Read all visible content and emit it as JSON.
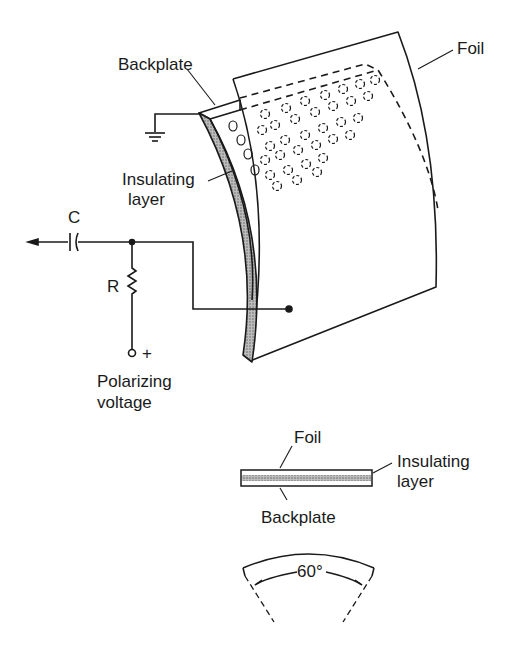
{
  "diagram": {
    "type": "electrostatic-microphone-schematic",
    "main_labels": {
      "backplate": "Backplate",
      "foil": "Foil",
      "insulating_line1": "Insulating",
      "insulating_line2": "layer",
      "capacitor": "C",
      "resistor": "R",
      "polarizing_line1": "Polarizing",
      "polarizing_line2": "voltage",
      "plus": "+"
    },
    "cross_section": {
      "foil": "Foil",
      "insulating_line1": "Insulating",
      "insulating_line2": "layer",
      "backplate": "Backplate"
    },
    "angle": {
      "label": "60°"
    },
    "colors": {
      "ink": "#1a1a1a",
      "hatch": "#8a8a8a",
      "background": "#ffffff"
    }
  }
}
